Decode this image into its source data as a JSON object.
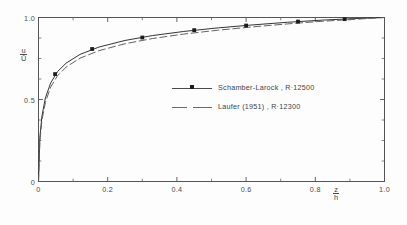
{
  "chart_data": {
    "type": "line",
    "title": "",
    "subtitle": "",
    "xlabel_numerator": "z",
    "xlabel_denominator": "h",
    "ylabel_numerator": "u",
    "ylabel_denominator": "Ū",
    "xlim": [
      0,
      1.0
    ],
    "ylim": [
      0,
      1.0
    ],
    "grid": false,
    "legend_position": "center",
    "x_ticks": [
      0,
      0.2,
      0.4,
      0.6,
      0.8,
      1.0
    ],
    "x_tick_labels": [
      "0",
      "0.2",
      "0.4",
      "0.6",
      "0.8",
      "1.0"
    ],
    "y_ticks": [
      0,
      0.5,
      1.0
    ],
    "y_tick_labels": [
      "0",
      "0.5",
      "1.0"
    ],
    "x_minor_ticks": [
      0.1,
      0.3,
      0.5,
      0.7,
      0.9
    ],
    "y_minor_ticks": [
      0.125,
      0.25,
      0.375,
      0.625,
      0.75,
      0.875
    ],
    "series": [
      {
        "name": "Schamber-Larock, R=12500",
        "style": "solid",
        "marker": "square",
        "color": "#2a2a2a",
        "x": [
          0.0,
          0.004,
          0.01,
          0.02,
          0.035,
          0.055,
          0.08,
          0.12,
          0.175,
          0.25,
          0.33,
          0.42,
          0.52,
          0.62,
          0.72,
          0.82,
          0.9,
          0.96,
          1.0
        ],
        "y": [
          0.0,
          0.27,
          0.4,
          0.51,
          0.6,
          0.67,
          0.722,
          0.775,
          0.82,
          0.86,
          0.89,
          0.915,
          0.937,
          0.955,
          0.971,
          0.984,
          0.992,
          0.997,
          1.0
        ],
        "marker_x": [
          0.048,
          0.155,
          0.3,
          0.45,
          0.6,
          0.75,
          0.885
        ],
        "marker_y": [
          0.655,
          0.808,
          0.878,
          0.923,
          0.951,
          0.975,
          0.99
        ]
      },
      {
        "name": "Laufer (1951), R=12300",
        "style": "dashed",
        "marker": "none",
        "color": "#5a5a5a",
        "x": [
          0.0,
          0.004,
          0.01,
          0.02,
          0.035,
          0.055,
          0.08,
          0.12,
          0.175,
          0.25,
          0.33,
          0.42,
          0.52,
          0.62,
          0.72,
          0.82,
          0.9,
          0.96,
          1.0
        ],
        "y": [
          0.0,
          0.25,
          0.375,
          0.483,
          0.575,
          0.645,
          0.698,
          0.752,
          0.798,
          0.84,
          0.872,
          0.899,
          0.923,
          0.943,
          0.961,
          0.977,
          0.987,
          0.995,
          1.0
        ]
      }
    ]
  },
  "axes": {
    "y_title": {
      "num": "u",
      "den": "Ū"
    },
    "x_title": {
      "num": "z",
      "den": "h"
    }
  },
  "legend": {
    "entries": [
      {
        "label": "Schamber-Larock ,  R·12500"
      },
      {
        "label": "Laufer (1951) ,  R·12300"
      }
    ]
  }
}
